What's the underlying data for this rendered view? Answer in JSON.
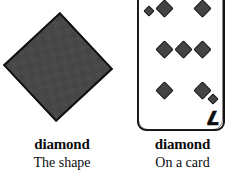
{
  "background_color": "#ffffff",
  "shape_fill_color": "#444444",
  "outline_color": "#141414",
  "panels": [
    {
      "id": "shape",
      "figure": "diamond-rhombus",
      "title": "diamond",
      "subtitle": "The shape"
    },
    {
      "id": "card",
      "figure": "playing-card-seven-of-diamonds",
      "title": "diamond",
      "subtitle": "On a card"
    }
  ],
  "card": {
    "rank": "7",
    "rank_bottom": "7",
    "suit": "diamonds",
    "pip_count": 7,
    "corner_pip_count": 2
  }
}
